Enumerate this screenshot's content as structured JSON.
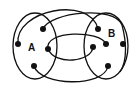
{
  "diagram": {
    "type": "set-mapping",
    "sets": [
      {
        "label": "A",
        "cx": 35,
        "cy": 46,
        "rx": 22,
        "ry": 33,
        "label_x": 28,
        "label_y": 51
      },
      {
        "label": "B",
        "cx": 106,
        "cy": 46,
        "rx": 22,
        "ry": 33,
        "label_x": 108,
        "label_y": 37
      }
    ],
    "points": {
      "A": [
        [
          18,
          44
        ],
        [
          43,
          29
        ],
        [
          48,
          49
        ],
        [
          34,
          66
        ]
      ],
      "B": [
        [
          98,
          29
        ],
        [
          106,
          44
        ],
        [
          123,
          44
        ],
        [
          93,
          47
        ],
        [
          108,
          66
        ]
      ]
    },
    "edges": [
      {
        "from": "A0",
        "to": "B0"
      },
      {
        "from": "A1",
        "to": "B4-side"
      },
      {
        "from": "A2",
        "to": "B1"
      },
      {
        "from": "A2",
        "to": "B3"
      },
      {
        "from": "A3",
        "to": "B4"
      }
    ],
    "colors": {
      "stroke": "#111111",
      "background": "#ffffff"
    }
  }
}
